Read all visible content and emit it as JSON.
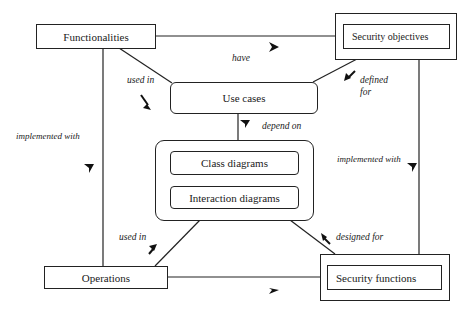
{
  "nodes": {
    "functionalities": "Functionalities",
    "security_objectives": "Security objectives",
    "use_cases": "Use cases",
    "class_diagrams": "Class diagrams",
    "interaction_diagrams": "Interaction diagrams",
    "operations": "Operations",
    "security_functions": "Security functions"
  },
  "edges": {
    "have": "have",
    "used_in_top": "used in",
    "defined": "defined",
    "for": "for",
    "depend_on": "depend on",
    "implemented_with_left": "implemented with",
    "implemented_with_right": "implemented with",
    "used_in_bottom": "used in",
    "designed_for": "designed for"
  },
  "relations": [
    {
      "from": "Functionalities",
      "to": "Security objectives",
      "label": "have"
    },
    {
      "from": "Functionalities",
      "to": "Use cases",
      "label": "used in"
    },
    {
      "from": "Security objectives",
      "to": "Use cases",
      "label": "defined for"
    },
    {
      "from": "Use cases",
      "to": "Class diagrams / Interaction diagrams",
      "label": "depend on"
    },
    {
      "from": "Functionalities",
      "to": "Operations",
      "label": "implemented with"
    },
    {
      "from": "Security objectives",
      "to": "Security functions",
      "label": "implemented with"
    },
    {
      "from": "Operations",
      "to": "Class diagrams / Interaction diagrams",
      "label": "used in"
    },
    {
      "from": "Class diagrams / Interaction diagrams",
      "to": "Security functions",
      "label": "designed for"
    },
    {
      "from": "Operations",
      "to": "Security functions",
      "label": ""
    }
  ]
}
